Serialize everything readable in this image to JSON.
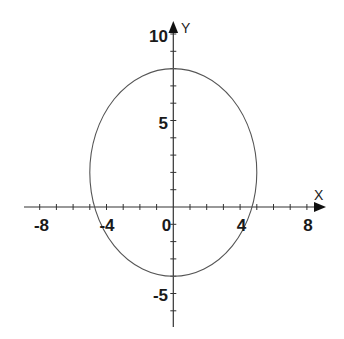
{
  "chart_data": {
    "type": "line",
    "title": "",
    "xlabel": "X",
    "ylabel": "Y",
    "xlim": [
      -9,
      9
    ],
    "ylim": [
      -7,
      11
    ],
    "grid": false,
    "legend": null,
    "x_ticks": [
      -8,
      -7,
      -6,
      -5,
      -4,
      -3,
      -2,
      -1,
      1,
      2,
      3,
      4,
      5,
      6,
      7,
      8
    ],
    "y_ticks": [
      -6,
      -5,
      -4,
      -3,
      -2,
      -1,
      1,
      2,
      3,
      4,
      5,
      6,
      7,
      8,
      9,
      10
    ],
    "x_tick_labels": [
      {
        "value": -8,
        "text": "-8"
      },
      {
        "value": -4,
        "text": "-4"
      },
      {
        "value": 4,
        "text": "4"
      },
      {
        "value": 8,
        "text": "8"
      }
    ],
    "y_tick_labels": [
      {
        "value": 10,
        "text": "10"
      },
      {
        "value": 5,
        "text": "5"
      },
      {
        "value": -5,
        "text": "-5"
      }
    ],
    "origin_label": "0",
    "series": [
      {
        "name": "ellipse",
        "shape": "ellipse",
        "equation": "x^2/25 + (y-2)^2/36 = 1",
        "center": [
          0,
          2
        ],
        "semi_axis_x": 5,
        "semi_axis_y": 6,
        "color": "#555555"
      }
    ]
  },
  "labels": {
    "x_axis_name": "X",
    "y_axis_name": "Y",
    "origin": "0",
    "x_ticks": {
      "neg8": "-8",
      "neg4": "-4",
      "pos4": "4",
      "pos8": "8"
    },
    "y_ticks": {
      "pos10": "10",
      "pos5": "5",
      "neg5": "-5"
    }
  },
  "colors": {
    "axis": "#333333",
    "curve": "#555555",
    "text": "#1a1a1a"
  }
}
